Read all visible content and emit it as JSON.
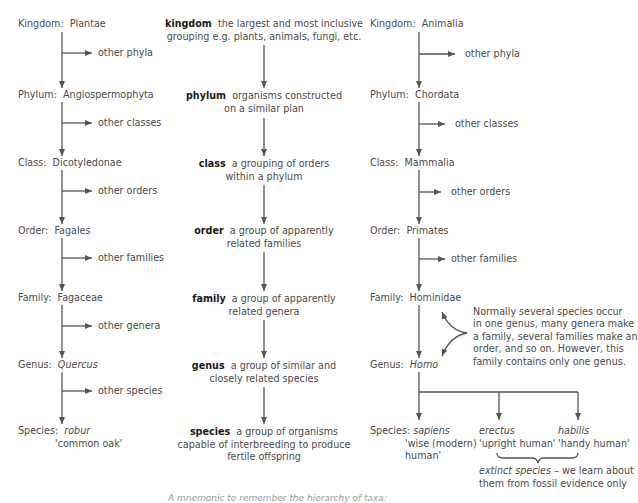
{
  "plant_column": {
    "ranks": [
      {
        "rank": "Kingdom:",
        "value": "Plantae",
        "italic": false
      },
      {
        "rank": "Phylum:",
        "value": "Angiospermophyta",
        "italic": false
      },
      {
        "rank": "Class:",
        "value": "Dicotyledonae",
        "italic": false
      },
      {
        "rank": "Order:",
        "value": "Fagales",
        "italic": false
      },
      {
        "rank": "Family:",
        "value": "Fagaceae",
        "italic": false
      },
      {
        "rank": "Genus:",
        "value": "Quercus",
        "italic": true
      },
      {
        "rank": "Species:",
        "value": "robur",
        "italic": true,
        "common_name": "'common oak'"
      }
    ],
    "branches": [
      "other phyla",
      "other classes",
      "other orders",
      "other families",
      "other genera",
      "other species"
    ]
  },
  "definitions": [
    {
      "term": "kingdom",
      "line1": "the largest and most inclusive",
      "line2": "grouping e.g. plants, animals, fungi, etc."
    },
    {
      "term": "phylum",
      "line1": "organisms constructed",
      "line2": "on a similar plan"
    },
    {
      "term": "class",
      "line1": "a grouping of orders",
      "line2": "within a phylum"
    },
    {
      "term": "order",
      "line1": "a group of apparently",
      "line2": "related families"
    },
    {
      "term": "family",
      "line1": "a group of apparently",
      "line2": "related genera"
    },
    {
      "term": "genus",
      "line1": "a group of similar and",
      "line2": "closely related species"
    },
    {
      "term": "species",
      "line1": "a group of organisms",
      "line2": "capable of interbreeding to produce",
      "line3": "fertile offspring"
    }
  ],
  "animal_column": {
    "ranks": [
      {
        "rank": "Kingdom:",
        "value": "Animalia",
        "italic": false
      },
      {
        "rank": "Phylum:",
        "value": "Chordata",
        "italic": false
      },
      {
        "rank": "Class:",
        "value": "Mammalia",
        "italic": false
      },
      {
        "rank": "Order:",
        "value": "Primates",
        "italic": false
      },
      {
        "rank": "Family:",
        "value": "Hominidae",
        "italic": false
      },
      {
        "rank": "Genus:",
        "value": "Homo",
        "italic": true
      },
      {
        "rank": "Species:",
        "value": "sapiens",
        "italic": true
      }
    ],
    "branches": [
      "other phyla",
      "other classes",
      "other orders",
      "other families"
    ],
    "species": [
      {
        "name": "sapiens",
        "common_line1": "'wise (modern)",
        "common_line2": "human'"
      },
      {
        "name": "erectus",
        "common_line1": "'upright human'"
      },
      {
        "name": "habilis",
        "common_line1": "'handy human'"
      }
    ],
    "note": {
      "lines": [
        "Normally several species occur",
        "in one genus, many genera make",
        "a family, several families make an",
        "order, and so on. However, this",
        "family contains only one genus."
      ]
    },
    "extinct_note": {
      "italic_part": "extinct species",
      "rest_line1": " – we learn about",
      "line2": "them from fossil evidence only"
    }
  },
  "footer": {
    "mnemonic": "A mnemonic to remember the hierarchy of taxa:"
  },
  "colors": {
    "text": "#4a4a4a",
    "term": "#1a1a1a",
    "line": "#555555"
  }
}
